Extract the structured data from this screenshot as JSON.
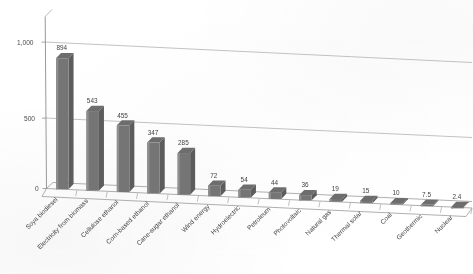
{
  "chart_data": {
    "type": "bar",
    "title": "",
    "subtitle": "",
    "xlabel": "",
    "ylabel": "",
    "ylim": [
      0,
      1000
    ],
    "yticks": [
      0,
      500,
      1000
    ],
    "ytick_labels": [
      "0",
      "500",
      "1,000"
    ],
    "grid": true,
    "legend": false,
    "legend_position": "none",
    "style_note": "3D column chart, grayscale, scanned page with slight downward skew",
    "categories": [
      "Soya biodiesel",
      "Electricity from biomass",
      "Cellulose ethanol",
      "Corn-based ethanol",
      "Cane-sugar ethanol",
      "Wind energy",
      "Hydroelectric",
      "Petroleum",
      "Photovoltaic",
      "Natural gas",
      "Thermal solar",
      "Coal",
      "Geothermic",
      "Nuclear"
    ],
    "values": [
      894,
      543,
      455,
      347,
      285,
      72,
      54,
      44,
      36,
      19,
      15,
      10,
      7.5,
      2.4
    ],
    "value_labels": [
      "894",
      "543",
      "455",
      "347",
      "285",
      "72",
      "54",
      "44",
      "36",
      "19",
      "15",
      "10",
      "7.5",
      "2.4"
    ],
    "colors": {
      "bar_front": "#757575",
      "bar_left": "#8f8f8f",
      "bar_top": "#6d6d6d",
      "axis": "#8d8d8d",
      "grid": "#b2b2b2",
      "text": "#3d3d3d",
      "background": "#ffffff"
    }
  },
  "axis": {
    "y_tick_0": "0",
    "y_tick_500": "500",
    "y_tick_1000": "1,000"
  }
}
